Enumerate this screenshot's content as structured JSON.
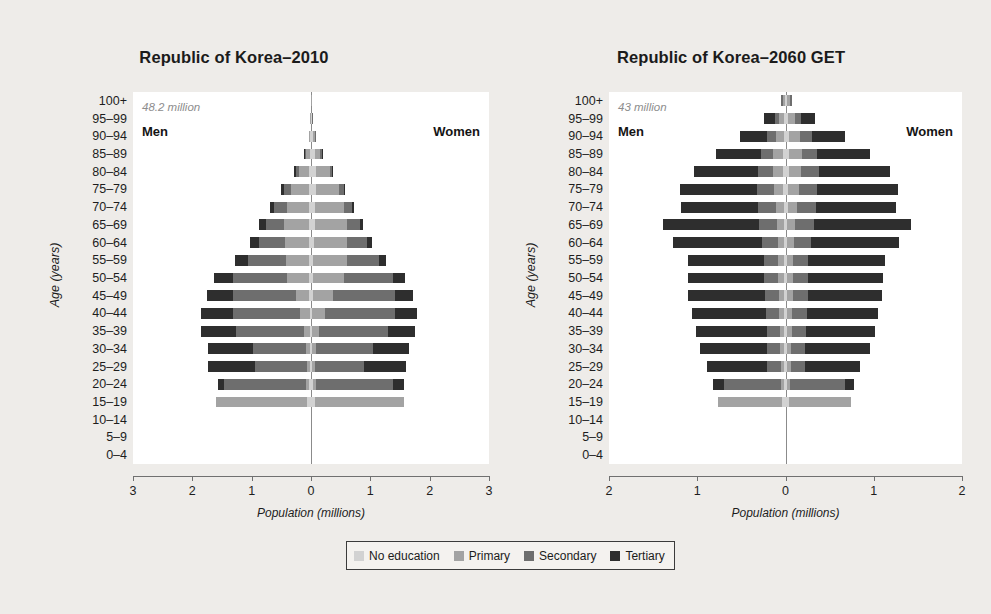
{
  "figure": {
    "background": "#eeece9",
    "xaxis_title": "Population (millions)",
    "yaxis_title": "Age (years)"
  },
  "legend": {
    "items": [
      {
        "label": "No education",
        "color": "#d2d2d2"
      },
      {
        "label": "Primary",
        "color": "#a3a3a3"
      },
      {
        "label": "Secondary",
        "color": "#6e6e6e"
      },
      {
        "label": "Tertiary",
        "color": "#2e2e2e"
      }
    ]
  },
  "chart_data": [
    {
      "type": "bar",
      "id": "korea-2010",
      "title": "Republic of Korea–2010",
      "annotation": "48.2 million",
      "left_label": "Men",
      "right_label": "Women",
      "xlabel": "Population (millions)",
      "ylabel": "Age (years)",
      "xlim": [
        -3,
        3
      ],
      "xticks": [
        3,
        2,
        1,
        0,
        1,
        2,
        3
      ],
      "categories": [
        "0–4",
        "5–9",
        "10–14",
        "15–19",
        "20–24",
        "25–29",
        "30–34",
        "35–39",
        "40–44",
        "45–49",
        "50–54",
        "55–59",
        "60–64",
        "65–69",
        "70–74",
        "75–79",
        "80–84",
        "85–89",
        "90–94",
        "95–99",
        "100+"
      ],
      "stack_order": [
        "No education",
        "Primary",
        "Secondary",
        "Tertiary"
      ],
      "men": [
        [
          0,
          0,
          0,
          0
        ],
        [
          0,
          0,
          0,
          0
        ],
        [
          0,
          0,
          0,
          0
        ],
        [
          0.06,
          1.54,
          0.0,
          0.0
        ],
        [
          0.03,
          0.06,
          1.37,
          0.11
        ],
        [
          0.02,
          0.05,
          0.88,
          0.78
        ],
        [
          0.02,
          0.06,
          0.89,
          0.76
        ],
        [
          0.02,
          0.1,
          1.14,
          0.59
        ],
        [
          0.02,
          0.16,
          1.13,
          0.54
        ],
        [
          0.03,
          0.23,
          1.06,
          0.44
        ],
        [
          0.03,
          0.38,
          0.9,
          0.33
        ],
        [
          0.03,
          0.4,
          0.63,
          0.23
        ],
        [
          0.03,
          0.41,
          0.43,
          0.16
        ],
        [
          0.03,
          0.43,
          0.3,
          0.12
        ],
        [
          0.03,
          0.38,
          0.21,
          0.08
        ],
        [
          0.03,
          0.3,
          0.13,
          0.05
        ],
        [
          0.03,
          0.17,
          0.06,
          0.02
        ],
        [
          0.02,
          0.07,
          0.02,
          0.01
        ],
        [
          0.01,
          0.02,
          0.01,
          0.0
        ],
        [
          0.004,
          0.005,
          0.002,
          0.0
        ],
        [
          0.001,
          0.001,
          0.0,
          0.0
        ]
      ],
      "women": [
        [
          0,
          0,
          0,
          0
        ],
        [
          0,
          0,
          0,
          0
        ],
        [
          0,
          0,
          0,
          0
        ],
        [
          0.06,
          1.5,
          0.0,
          0.0
        ],
        [
          0.03,
          0.06,
          1.3,
          0.17
        ],
        [
          0.02,
          0.05,
          0.83,
          0.71
        ],
        [
          0.02,
          0.07,
          0.95,
          0.61
        ],
        [
          0.02,
          0.12,
          1.16,
          0.45
        ],
        [
          0.02,
          0.21,
          1.18,
          0.38
        ],
        [
          0.03,
          0.34,
          1.05,
          0.3
        ],
        [
          0.03,
          0.52,
          0.83,
          0.2
        ],
        [
          0.04,
          0.56,
          0.54,
          0.13
        ],
        [
          0.05,
          0.56,
          0.33,
          0.09
        ],
        [
          0.06,
          0.55,
          0.21,
          0.06
        ],
        [
          0.07,
          0.48,
          0.14,
          0.04
        ],
        [
          0.09,
          0.38,
          0.09,
          0.02
        ],
        [
          0.09,
          0.23,
          0.04,
          0.01
        ],
        [
          0.06,
          0.1,
          0.02,
          0.004
        ],
        [
          0.03,
          0.03,
          0.006,
          0.0
        ],
        [
          0.01,
          0.008,
          0.002,
          0.0
        ],
        [
          0.003,
          0.002,
          0.0,
          0.0
        ]
      ]
    },
    {
      "type": "bar",
      "id": "korea-2060-get",
      "title": "Republic of Korea–2060 GET",
      "annotation": "43 million",
      "left_label": "Men",
      "right_label": "Women",
      "xlabel": "Population (millions)",
      "ylabel": "Age (years)",
      "xlim": [
        -2,
        2
      ],
      "xticks": [
        2,
        1,
        0,
        1,
        2
      ],
      "categories": [
        "0–4",
        "5–9",
        "10–14",
        "15–19",
        "20–24",
        "25–29",
        "30–34",
        "35–39",
        "40–44",
        "45–49",
        "50–54",
        "55–59",
        "60–64",
        "65–69",
        "70–74",
        "75–79",
        "80–84",
        "85–89",
        "90–94",
        "95–99",
        "100+"
      ],
      "stack_order": [
        "No education",
        "Primary",
        "Secondary",
        "Tertiary"
      ],
      "men": [
        [
          0,
          0,
          0,
          0
        ],
        [
          0,
          0,
          0,
          0
        ],
        [
          0,
          0,
          0,
          0
        ],
        [
          0.04,
          0.73,
          0.0,
          0.0
        ],
        [
          0.02,
          0.03,
          0.65,
          0.12
        ],
        [
          0.02,
          0.03,
          0.16,
          0.68
        ],
        [
          0.02,
          0.04,
          0.15,
          0.76
        ],
        [
          0.02,
          0.04,
          0.15,
          0.8
        ],
        [
          0.02,
          0.05,
          0.15,
          0.84
        ],
        [
          0.02,
          0.05,
          0.16,
          0.87
        ],
        [
          0.02,
          0.06,
          0.16,
          0.87
        ],
        [
          0.02,
          0.06,
          0.16,
          0.87
        ],
        [
          0.02,
          0.07,
          0.18,
          1.0
        ],
        [
          0.02,
          0.08,
          0.2,
          1.09
        ],
        [
          0.02,
          0.09,
          0.2,
          0.88
        ],
        [
          0.03,
          0.1,
          0.19,
          0.88
        ],
        [
          0.03,
          0.11,
          0.17,
          0.73
        ],
        [
          0.03,
          0.11,
          0.14,
          0.51
        ],
        [
          0.02,
          0.09,
          0.1,
          0.31
        ],
        [
          0.02,
          0.05,
          0.05,
          0.12
        ],
        [
          0.01,
          0.02,
          0.02,
          0.0
        ]
      ],
      "women": [
        [
          0,
          0,
          0,
          0
        ],
        [
          0,
          0,
          0,
          0
        ],
        [
          0,
          0,
          0,
          0
        ],
        [
          0.04,
          0.7,
          0.0,
          0.0
        ],
        [
          0.02,
          0.03,
          0.63,
          0.1
        ],
        [
          0.02,
          0.04,
          0.16,
          0.63
        ],
        [
          0.02,
          0.04,
          0.16,
          0.74
        ],
        [
          0.02,
          0.05,
          0.16,
          0.78
        ],
        [
          0.02,
          0.05,
          0.17,
          0.81
        ],
        [
          0.02,
          0.06,
          0.17,
          0.84
        ],
        [
          0.02,
          0.06,
          0.17,
          0.85
        ],
        [
          0.02,
          0.07,
          0.17,
          0.87
        ],
        [
          0.02,
          0.08,
          0.19,
          1.0
        ],
        [
          0.02,
          0.09,
          0.21,
          1.1
        ],
        [
          0.03,
          0.1,
          0.22,
          0.9
        ],
        [
          0.03,
          0.12,
          0.21,
          0.92
        ],
        [
          0.04,
          0.14,
          0.2,
          0.8
        ],
        [
          0.04,
          0.15,
          0.17,
          0.6
        ],
        [
          0.04,
          0.13,
          0.13,
          0.38
        ],
        [
          0.03,
          0.08,
          0.07,
          0.15
        ],
        [
          0.02,
          0.03,
          0.02,
          0.0
        ]
      ]
    }
  ]
}
